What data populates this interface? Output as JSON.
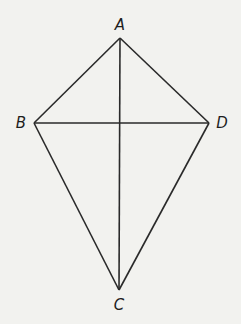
{
  "diagram": {
    "type": "kite",
    "background": "#f2f2ef",
    "stroke_color": "#2a2a2a",
    "vertices": [
      {
        "name": "A",
        "x": 120,
        "y": 38,
        "label_x": 120,
        "label_y": 30
      },
      {
        "name": "B",
        "x": 34,
        "y": 123,
        "label_x": 21,
        "label_y": 128
      },
      {
        "name": "D",
        "x": 209,
        "y": 123,
        "label_x": 222,
        "label_y": 128
      },
      {
        "name": "C",
        "x": 119,
        "y": 290,
        "label_x": 119,
        "label_y": 310
      }
    ],
    "edges": [
      [
        "A",
        "B"
      ],
      [
        "A",
        "D"
      ],
      [
        "B",
        "C"
      ],
      [
        "D",
        "C"
      ]
    ],
    "diagonals": [
      [
        "A",
        "C"
      ],
      [
        "B",
        "D"
      ]
    ]
  }
}
